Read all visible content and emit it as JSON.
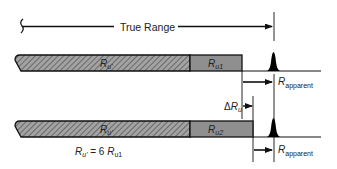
{
  "diagram": {
    "true_range_label": "True Range",
    "bar1": {
      "ambiguous_label": {
        "main": "R",
        "sub": "u'"
      },
      "remainder_label": {
        "main": "R",
        "sub": "u1"
      }
    },
    "bar2": {
      "ambiguous_label": {
        "main": "R",
        "sub": "u'"
      },
      "remainder_label": {
        "main": "R",
        "sub": "u2"
      }
    },
    "apparent_range_1": {
      "main": "R",
      "sub": "apparent"
    },
    "apparent_range_2": {
      "main": "R",
      "sub": "apparent"
    },
    "delta_label": {
      "prefix": "Δ",
      "main": "R",
      "sub": "u"
    },
    "equation": {
      "lhs_main": "R",
      "lhs_sub": "u'",
      "op": " = 6 ",
      "rhs_main": "R",
      "rhs_sub": "u1"
    },
    "colors": {
      "line": "#111111",
      "hatch_bg": "#9a9a9a",
      "hatch_line": "#555555",
      "solid_segment": "#8f8f8f",
      "pulse": "#000000"
    }
  }
}
